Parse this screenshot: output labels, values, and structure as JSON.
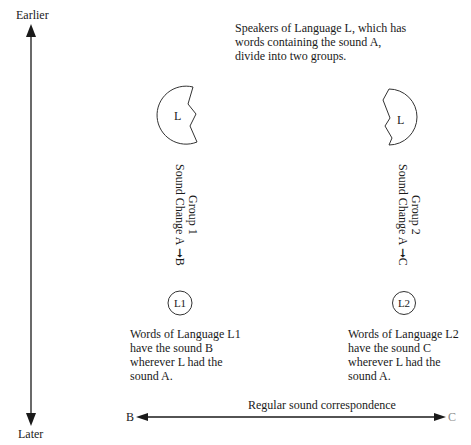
{
  "timeline": {
    "top_label": "Earlier",
    "bottom_label": "Later"
  },
  "intro_text": [
    "Speakers of Language L, which has",
    "words containing the sound A,",
    "divide into two groups."
  ],
  "groups": [
    {
      "parent_label": "L",
      "group_name": "Group 1",
      "sound_change": "Sound Change A",
      "arrow_target": "B",
      "daughter_label": "L1",
      "description": [
        "Words of Language L1",
        "have the sound B",
        "wherever L had the",
        "sound A."
      ]
    },
    {
      "parent_label": "L",
      "group_name": "Group 2",
      "sound_change": "Sound Change A",
      "arrow_target": "C",
      "daughter_label": "L2",
      "description": [
        "Words of Language L2",
        "have the sound C",
        "wherever L had the",
        "sound A."
      ]
    }
  ],
  "correspondence": {
    "label": "Regular sound correspondence",
    "left_end": "B",
    "right_end": "C"
  },
  "colors": {
    "line": "#1a1a1a",
    "faded_label": "#8a8a8a"
  }
}
